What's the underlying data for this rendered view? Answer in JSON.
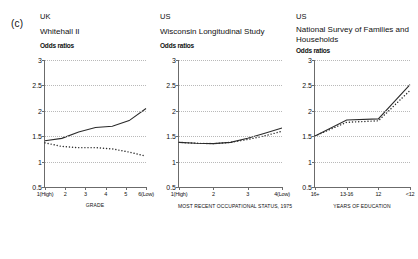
{
  "figure": {
    "panel_letter": "(c)"
  },
  "chart_data": [
    {
      "type": "line",
      "country": "UK",
      "title": "Whitehall II",
      "ylabel": "Odds ratios",
      "xlabel": "GRADE",
      "categories": [
        "1(High)",
        "2",
        "3",
        "4",
        "5",
        "6(Low)"
      ],
      "ylim": [
        0.5,
        3
      ],
      "yticks": [
        0.5,
        1,
        1.5,
        2,
        2.5,
        3
      ],
      "ytick_labels": [
        "0.5",
        "1",
        "1.5",
        "2",
        "2.5",
        "3"
      ],
      "grid": true,
      "legend": "none",
      "series": [
        {
          "name": "solid",
          "style": "solid",
          "values": [
            1.0,
            1.06,
            1.22,
            1.33,
            1.36,
            1.5,
            1.8
          ]
        },
        {
          "name": "dotted",
          "style": "dotted",
          "values": [
            0.95,
            0.86,
            0.83,
            0.83,
            0.8,
            0.72,
            0.62
          ]
        }
      ]
    },
    {
      "type": "line",
      "country": "US",
      "title": "Wisconsin Longitudinal Study",
      "ylabel": "Odds ratios",
      "xlabel": "MOST RECENT OCCUPATIONAL STATUS, 1975",
      "categories": [
        "1(High)",
        "2",
        "3",
        "4(Low)"
      ],
      "ylim": [
        0.5,
        3
      ],
      "yticks": [
        0.5,
        1,
        1.5,
        2,
        2.5,
        3
      ],
      "ytick_labels": [
        "0.5",
        "1",
        "1.5",
        "2",
        "2.5",
        "3"
      ],
      "grid": true,
      "legend": "none",
      "series": [
        {
          "name": "solid",
          "style": "solid",
          "values": [
            1.0,
            0.98,
            0.97,
            1.0,
            1.1,
            1.22,
            1.35
          ]
        },
        {
          "name": "dotted",
          "style": "dotted",
          "values": [
            1.0,
            0.98,
            0.97,
            1.0,
            1.07,
            1.16,
            1.27
          ]
        }
      ]
    },
    {
      "type": "line",
      "country": "US",
      "title": "National Survey of Families and Households",
      "ylabel": "Odds ratios",
      "xlabel": "YEARS OF EDUCATION",
      "categories": [
        "16+",
        "13-16",
        "12",
        "<12"
      ],
      "ylim": [
        0.5,
        3
      ],
      "yticks": [
        0.5,
        1,
        1.5,
        2,
        2.5,
        3
      ],
      "ytick_labels": [
        "0.5",
        "1",
        "1.5",
        "2",
        "2.5",
        "3"
      ],
      "grid": true,
      "legend": "none",
      "series": [
        {
          "name": "solid",
          "style": "solid",
          "values": [
            1.0,
            1.42,
            1.45,
            2.35
          ]
        },
        {
          "name": "dotted",
          "style": "dotted",
          "values": [
            1.0,
            1.36,
            1.4,
            2.2
          ]
        }
      ]
    }
  ]
}
